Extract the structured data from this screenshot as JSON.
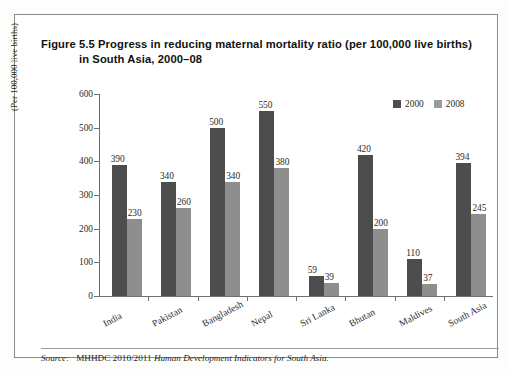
{
  "figure": {
    "title_line1": "Figure 5.5 Progress in reducing maternal mortality ratio (per 100,000 live births)",
    "title_line2": "in South Asia, 2000–08",
    "source_prefix": "Source:",
    "source_plain": "MHHDC 2010/2011",
    "source_italic": "Human Development Indicators for South Asia."
  },
  "legend": {
    "position": "top-right",
    "items": [
      {
        "label": "2000",
        "color": "#4d4d4d"
      },
      {
        "label": "2008",
        "color": "#9a9a9a"
      }
    ]
  },
  "chart_data": {
    "type": "bar",
    "title": "Figure 5.5 Progress in reducing maternal mortality ratio (per 100,000 live births) in South Asia, 2000–08",
    "xlabel": "",
    "ylabel": "(Per 100,000 live births)",
    "ylim": [
      0,
      600
    ],
    "yticks": [
      0,
      100,
      200,
      300,
      400,
      500,
      600
    ],
    "ytick_labels": [
      "0",
      "100",
      "200",
      "300",
      "400",
      "500",
      "600"
    ],
    "grid": false,
    "categories": [
      "India",
      "Pakistan",
      "Bangladesh",
      "Nepal",
      "Sri Lanka",
      "Bhutan",
      "Maldives",
      "South Asia"
    ],
    "series": [
      {
        "name": "2000",
        "color": "#4d4d4d",
        "values": [
          390,
          340,
          500,
          550,
          59,
          420,
          110,
          394
        ],
        "labels": [
          "390",
          "340",
          "500",
          "550",
          "59",
          "420",
          "110",
          "394"
        ]
      },
      {
        "name": "2008",
        "color": "#8e8e8e",
        "values": [
          230,
          260,
          340,
          380,
          39,
          200,
          37,
          245
        ],
        "labels": [
          "230",
          "260",
          "340",
          "380",
          "39",
          "200",
          "37",
          "245"
        ]
      }
    ]
  }
}
